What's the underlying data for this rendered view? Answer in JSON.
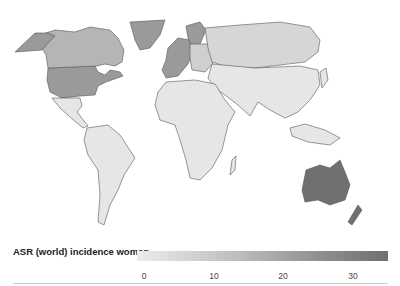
{
  "map": {
    "title": "ASR (world) incidence women",
    "projection": "world",
    "colors": {
      "very_low": "#e6e6e6",
      "low": "#d6d6d6",
      "medium": "#b5b5b5",
      "high": "#9a9a9a",
      "very_high": "#707070",
      "border": "#555555",
      "background": "#ffffff"
    },
    "regions": [
      {
        "name": "North America (USA)",
        "shade": "high"
      },
      {
        "name": "Canada",
        "shade": "medium"
      },
      {
        "name": "Greenland",
        "shade": "high"
      },
      {
        "name": "Western Europe",
        "shade": "high"
      },
      {
        "name": "Russia",
        "shade": "low"
      },
      {
        "name": "Latin America",
        "shade": "very_low"
      },
      {
        "name": "Africa",
        "shade": "very_low"
      },
      {
        "name": "Asia",
        "shade": "very_low"
      },
      {
        "name": "Australia",
        "shade": "very_high"
      },
      {
        "name": "New Zealand",
        "shade": "very_high"
      }
    ]
  },
  "legend": {
    "title": "ASR (world) incidence women",
    "ticks": [
      "0",
      "10",
      "20",
      "30"
    ],
    "range": [
      0,
      35
    ],
    "gradient": [
      "#ececec",
      "#707070"
    ]
  }
}
